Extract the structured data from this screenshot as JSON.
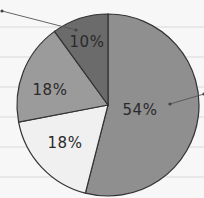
{
  "chart_data": {
    "type": "pie",
    "title": "",
    "categories": [
      "Slice A",
      "Slice B",
      "Slice C",
      "Slice D"
    ],
    "values": [
      54,
      18,
      18,
      10
    ],
    "labels": [
      "54%",
      "18%",
      "18%",
      "10%"
    ],
    "colors": [
      "#8f8f8f",
      "#f0f0f0",
      "#9b9b9b",
      "#6b6b6b"
    ],
    "start_angle_deg": 0,
    "direction": "clockwise",
    "legend": "none",
    "grid": "horizontal lines in background",
    "leader_lines": [
      {
        "slice_label": "10%",
        "from": [
          76,
          30
        ],
        "to": [
          2,
          11
        ]
      },
      {
        "slice_label": "54%",
        "from": [
          170,
          104
        ],
        "to": [
          204,
          94
        ]
      }
    ]
  },
  "background": {
    "color": "#f7f7f7",
    "gridline_color": "#d9d9d9",
    "gridlines_y": [
      27,
      57,
      87,
      117,
      147,
      177
    ]
  }
}
